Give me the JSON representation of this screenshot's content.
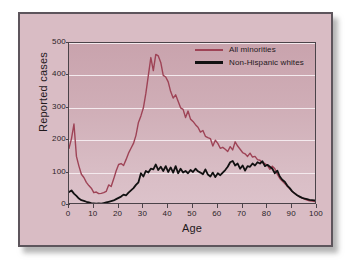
{
  "figure": {
    "background_color": "#d9bcc4",
    "border_color": "#5d555c"
  },
  "legend": {
    "position": "top-right",
    "entries": [
      {
        "label": "All minorities",
        "color": "#9e4356"
      },
      {
        "label": "Non-Hispanic whites",
        "color": "#111111"
      }
    ]
  },
  "axes": {
    "y_title": "Reported cases",
    "x_title": "Age",
    "y_ticks": [
      "500",
      "400",
      "300",
      "200",
      "100",
      "0"
    ],
    "x_ticks": [
      "0",
      "10",
      "20",
      "30",
      "40",
      "50",
      "60",
      "70",
      "80",
      "90",
      "100"
    ]
  },
  "chart_data": {
    "type": "line",
    "title": "",
    "xlabel": "Age",
    "ylabel": "Reported cases",
    "xlim": [
      0,
      100
    ],
    "ylim": [
      0,
      500
    ],
    "grid": true,
    "gridlines_y": [
      100,
      200,
      300,
      400,
      500
    ],
    "legend_position": "top-right",
    "x": [
      0,
      1,
      2,
      3,
      4,
      5,
      6,
      7,
      8,
      9,
      10,
      11,
      12,
      13,
      14,
      15,
      16,
      17,
      18,
      19,
      20,
      21,
      22,
      23,
      24,
      25,
      26,
      27,
      28,
      29,
      30,
      31,
      32,
      33,
      34,
      35,
      36,
      37,
      38,
      39,
      40,
      41,
      42,
      43,
      44,
      45,
      46,
      47,
      48,
      49,
      50,
      51,
      52,
      53,
      54,
      55,
      56,
      57,
      58,
      59,
      60,
      61,
      62,
      63,
      64,
      65,
      66,
      67,
      68,
      69,
      70,
      71,
      72,
      73,
      74,
      75,
      76,
      77,
      78,
      79,
      80,
      81,
      82,
      83,
      84,
      85,
      86,
      87,
      88,
      89,
      90,
      91,
      92,
      93,
      94,
      95,
      96,
      97,
      98,
      99,
      100
    ],
    "series": [
      {
        "name": "All minorities",
        "color": "#9e4356",
        "values": [
          175,
          205,
          250,
          150,
          120,
          95,
          85,
          70,
          60,
          52,
          38,
          40,
          35,
          36,
          38,
          42,
          62,
          57,
          80,
          105,
          125,
          128,
          122,
          140,
          160,
          175,
          190,
          215,
          255,
          275,
          300,
          345,
          400,
          455,
          415,
          465,
          460,
          440,
          400,
          395,
          380,
          350,
          330,
          340,
          320,
          300,
          295,
          270,
          290,
          265,
          258,
          248,
          240,
          225,
          230,
          212,
          208,
          205,
          182,
          200,
          190,
          175,
          178,
          172,
          165,
          180,
          170,
          195,
          182,
          172,
          162,
          158,
          150,
          160,
          148,
          150,
          140,
          138,
          130,
          128,
          122,
          110,
          120,
          112,
          95,
          82,
          74,
          66,
          58,
          50,
          42,
          36,
          30,
          25,
          22,
          18,
          15,
          13,
          12,
          11,
          10
        ]
      },
      {
        "name": "Non-Hispanic whites",
        "color": "#111111",
        "values": [
          40,
          45,
          35,
          28,
          20,
          15,
          13,
          10,
          8,
          6,
          5,
          4,
          5,
          4,
          6,
          8,
          10,
          12,
          14,
          18,
          22,
          26,
          32,
          30,
          38,
          45,
          52,
          62,
          70,
          98,
          88,
          105,
          100,
          112,
          110,
          125,
          108,
          118,
          105,
          120,
          102,
          116,
          100,
          120,
          98,
          112,
          100,
          105,
          98,
          108,
          102,
          112,
          104,
          100,
          95,
          110,
          94,
          88,
          100,
          86,
          98,
          92,
          100,
          108,
          118,
          132,
          136,
          122,
          128,
          112,
          122,
          106,
          120,
          118,
          128,
          122,
          132,
          128,
          135,
          120,
          124,
          118,
          112,
          98,
          106,
          88,
          78,
          72,
          60,
          52,
          42,
          36,
          30,
          26,
          22,
          20,
          18,
          16,
          15,
          14,
          13
        ]
      }
    ]
  }
}
